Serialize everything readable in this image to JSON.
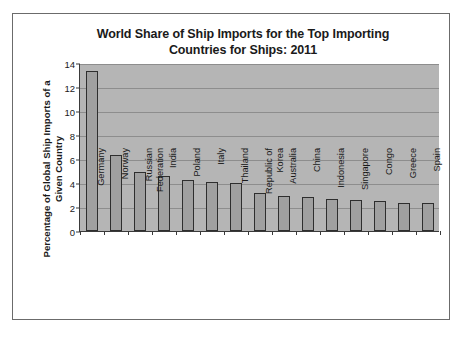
{
  "figure": {
    "title_lines": [
      "World Share of Ship Imports for the Top Importing",
      "Countries for Ships: 2011"
    ],
    "ylabel_lines": [
      "Percentage of Global Ship Imports of a",
      "Given Country"
    ],
    "colors": {
      "plot_background": "#b5b5b5",
      "bar_fill": "#a0a0a0",
      "bar_edge": "#2e2e2e",
      "gridline": "#8d8d8d",
      "axis": "#3a3a3a",
      "text": "#1a1a1a",
      "page_background": "#ffffff",
      "frame_border": "#6b6b6b"
    }
  },
  "chart_data": {
    "type": "bar",
    "xlabel": "",
    "ylabel": "Percentage of Global Ship Imports of a Given Country",
    "ylim": [
      0,
      14
    ],
    "yticks": [
      0,
      2,
      4,
      6,
      8,
      10,
      12,
      14
    ],
    "ytick_labels": [
      "0",
      "2",
      "4",
      "6",
      "8",
      "10",
      "12",
      "14"
    ],
    "grid": true,
    "legend": false,
    "categories": [
      "Germany",
      "Norway",
      "Russian Federation",
      "India",
      "Poland",
      "Italy",
      "Thailand",
      "Republic of Korea",
      "Australia",
      "China",
      "Indonesia",
      "Singapore",
      "Congo",
      "Greece",
      "Spain"
    ],
    "category_label_lines": [
      [
        "Germany"
      ],
      [
        "Norway"
      ],
      [
        "Russian",
        "Federation"
      ],
      [
        "India"
      ],
      [
        "Poland"
      ],
      [
        "Italy"
      ],
      [
        "Thailand"
      ],
      [
        "Republic of",
        "Korea"
      ],
      [
        "Australia"
      ],
      [
        "China"
      ],
      [
        "Indonesia"
      ],
      [
        "Singapore"
      ],
      [
        "Congo"
      ],
      [
        "Greece"
      ],
      [
        "Spain"
      ]
    ],
    "values": [
      13.3,
      6.3,
      4.9,
      4.55,
      4.25,
      4.1,
      4.0,
      3.2,
      2.9,
      2.8,
      2.65,
      2.55,
      2.5,
      2.3,
      2.3
    ]
  }
}
